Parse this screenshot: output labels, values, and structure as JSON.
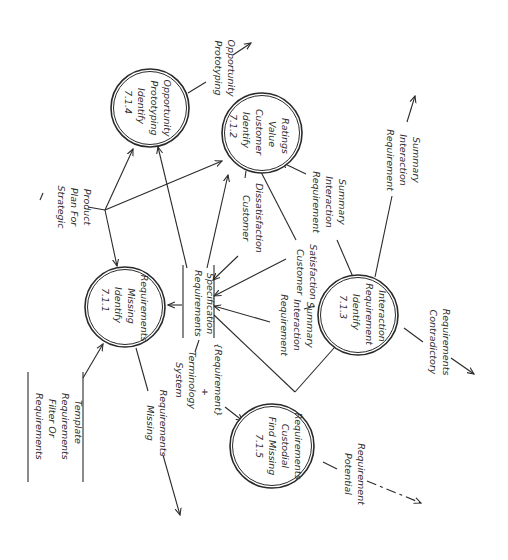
{
  "diagram": {
    "title": "",
    "orientation": "rotated-90-clockwise",
    "processes": [
      {
        "id": "7.1.4",
        "lines": [
          "7.1.4",
          "Identify",
          "Prototyping",
          "Opportunity"
        ]
      },
      {
        "id": "7.1.2",
        "lines": [
          "7.1.2",
          "Identify",
          "Customer",
          "Value",
          "Ratings"
        ]
      },
      {
        "id": "7.1.1",
        "lines": [
          "7.1.1",
          "Identify",
          "Missing",
          "Requirements"
        ]
      },
      {
        "id": "7.1.3",
        "lines": [
          "7.1.3",
          "Identify",
          "Requirement",
          "Interaction"
        ]
      },
      {
        "id": "7.1.5",
        "lines": [
          "7.1.5",
          "Find Missing",
          "Custodial",
          "Requirements"
        ]
      }
    ],
    "stores": [
      {
        "id": "requirements-specification",
        "lines": [
          "Requirements",
          "Specification"
        ]
      },
      {
        "id": "requirements-filter",
        "lines": [
          "Requirements",
          "Filter Or",
          "Requirements",
          "Template"
        ]
      }
    ],
    "flows": [
      {
        "id": "prototyping-opportunity",
        "lines": [
          "Prototyping",
          "Opportunity"
        ]
      },
      {
        "id": "strategic-plan",
        "lines": [
          "Strategic",
          "Plan For",
          "Product"
        ]
      },
      {
        "id": "customer-dissatisfaction",
        "lines": [
          "Customer",
          "Dissatisfaction"
        ]
      },
      {
        "id": "customer-satisfaction",
        "lines": [
          "Customer",
          "Satisfaction"
        ]
      },
      {
        "id": "req-interaction-summary-1",
        "lines": [
          "Requirement",
          "Interaction",
          "Summary"
        ]
      },
      {
        "id": "req-interaction-summary-2",
        "lines": [
          "Requirement",
          "Interaction",
          "Summary"
        ]
      },
      {
        "id": "req-interaction-summary-3",
        "lines": [
          "Requirement",
          "Interaction",
          "Summary"
        ]
      },
      {
        "id": "missing-requirements",
        "lines": [
          "Missing",
          "Requirements"
        ]
      },
      {
        "id": "system-terminology",
        "lines": [
          "System",
          "Terminology",
          "+",
          "{Requirement}"
        ]
      },
      {
        "id": "contradictory-requirements",
        "lines": [
          "Contradictory",
          "Requirements"
        ]
      },
      {
        "id": "potential-requirement",
        "lines": [
          "Potential",
          "Requirement"
        ]
      }
    ]
  }
}
